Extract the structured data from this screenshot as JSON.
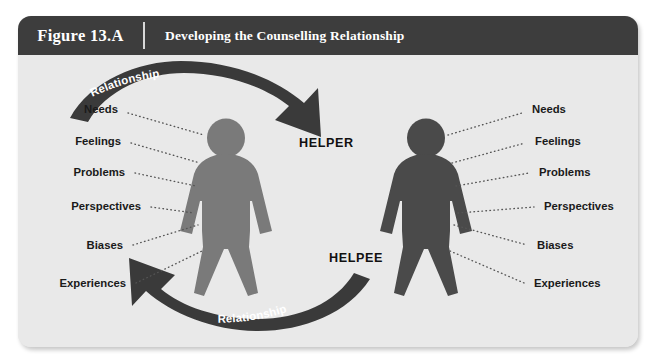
{
  "figure": {
    "number_label": "Figure 13.A",
    "title": "Developing the Counselling Relationship"
  },
  "colors": {
    "panel_background": "#e9e9e9",
    "header_background": "#3d3d3d",
    "header_text": "#ffffff",
    "helper_figure": "#7a7a7a",
    "helpee_figure": "#4a4a4a",
    "arrow": "#3a3a3a",
    "arrow_text": "#ffffff",
    "label_text": "#1a1a1a",
    "leader_line": "#555555"
  },
  "diagram": {
    "helper": {
      "role_label": "HELPER",
      "attributes": [
        "Needs",
        "Feelings",
        "Problems",
        "Perspectives",
        "Biases",
        "Experiences"
      ]
    },
    "helpee": {
      "role_label": "HELPEE",
      "attributes": [
        "Needs",
        "Feelings",
        "Problems",
        "Perspectives",
        "Biases",
        "Experiences"
      ]
    },
    "arrows": [
      {
        "name": "top-arrow",
        "label": "Relationship",
        "direction": "helper-to-helpee"
      },
      {
        "name": "bottom-arrow",
        "label": "Relationship",
        "direction": "helpee-to-helper"
      }
    ]
  }
}
